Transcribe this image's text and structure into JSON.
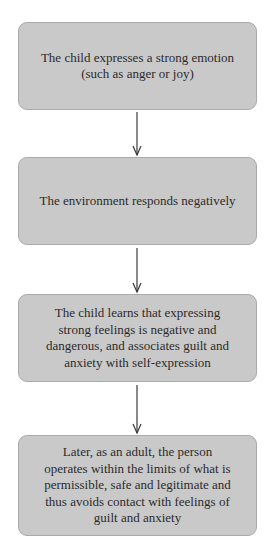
{
  "diagram": {
    "type": "flowchart",
    "direction": "top-to-bottom",
    "colors": {
      "box_fill": "#c9c9c9",
      "box_border": "#aaaaaa",
      "text": "#2b2b2b",
      "arrow": "#3a3a3a",
      "background": "#ffffff"
    },
    "nodes": [
      {
        "id": "1",
        "lines": [
          "The child expresses a strong emotion",
          "(such as anger or joy)"
        ]
      },
      {
        "id": "2",
        "lines": [
          "The environment responds negatively"
        ]
      },
      {
        "id": "3",
        "lines": [
          "The child learns that expressing",
          "strong feelings is negative and",
          "dangerous, and associates guilt and",
          "anxiety with self-expression"
        ]
      },
      {
        "id": "4",
        "lines": [
          "Later, as an adult, the person",
          "operates within the limits of what is",
          "permissible, safe and legitimate and",
          "thus avoids contact with feelings of",
          "guilt and anxiety"
        ]
      }
    ],
    "edges": [
      {
        "from": "1",
        "to": "2"
      },
      {
        "from": "2",
        "to": "3"
      },
      {
        "from": "3",
        "to": "4"
      }
    ]
  }
}
